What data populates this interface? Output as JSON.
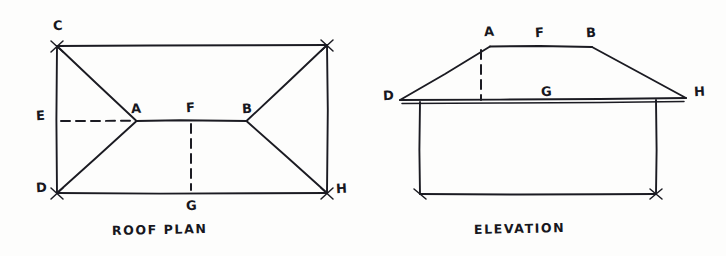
{
  "figure": {
    "kind": "hand-drawn-architectural-sketch",
    "background_color": "#fdfdfc",
    "ink_color": "#1b1b22"
  },
  "roof_plan": {
    "caption": "ROOF PLAN",
    "labels": {
      "c": "C",
      "e": "E",
      "d": "D",
      "a": "A",
      "f": "F",
      "b": "B",
      "g": "G",
      "h": "H"
    },
    "geometry": {
      "rect_top_left": [
        57,
        46
      ],
      "rect_top_right": [
        327,
        45
      ],
      "rect_bottom_right": [
        327,
        193
      ],
      "rect_bottom_left": [
        57,
        193
      ],
      "ridge_a": [
        136,
        121
      ],
      "ridge_b": [
        247,
        121
      ],
      "midpoint_f": [
        191,
        120
      ],
      "hip_lines": [
        "C-A",
        "D-A",
        "top_right-B",
        "H-B",
        "A-B"
      ],
      "dashed_lines": [
        "E-A horizontal centre line",
        "F-G vertical centre line"
      ]
    }
  },
  "elevation": {
    "caption": "ELEVATION",
    "labels": {
      "a": "A",
      "f": "F",
      "b": "B",
      "d": "D",
      "g": "G",
      "h": "H"
    },
    "geometry": {
      "ridge_left_a": [
        490,
        46
      ],
      "ridge_right_b": [
        592,
        47
      ],
      "eave_left_d": [
        400,
        100
      ],
      "eave_right_h": [
        686,
        98
      ],
      "wall_left_top": [
        420,
        102
      ],
      "wall_right_top": [
        656,
        100
      ],
      "wall_left_bottom": [
        420,
        194
      ],
      "wall_right_bottom": [
        656,
        194
      ],
      "dashed_lines": [
        "F-G vertical from ridge to eave line"
      ]
    }
  }
}
